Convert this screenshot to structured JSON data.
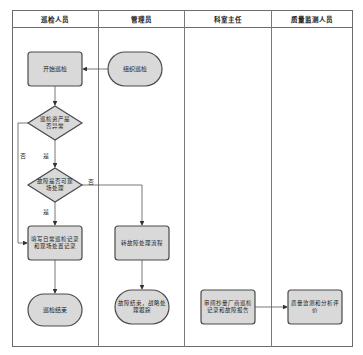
{
  "lanes": [
    {
      "label": "巡检人员"
    },
    {
      "label": "管理员"
    },
    {
      "label": "科室主任"
    },
    {
      "label": "质量监测人员"
    }
  ],
  "nodes": {
    "start_inspection": "开始巡检",
    "organize_inspection": "组织巡检",
    "asset_abnormal": "巡检资产是否异常",
    "fault_onsite": "故障是否可现场处理",
    "fill_records": "填写日常巡检记录和现场处置记录",
    "inspection_end": "巡检结束",
    "transfer_fault": "转故障处理流程",
    "fault_end": "故障结束，战略处理跟踪",
    "review_reports": "审阅抄量厂商巡检记录和故障报告",
    "quality_eval": "质量监测和分析评价"
  },
  "edge_labels": {
    "no_left": "否",
    "yes_1": "是",
    "no_right": "否",
    "yes_2": "是"
  },
  "colors": {
    "node_fill": "#d9d9d9",
    "node_border": "#4a4a4a",
    "line": "#555555"
  }
}
